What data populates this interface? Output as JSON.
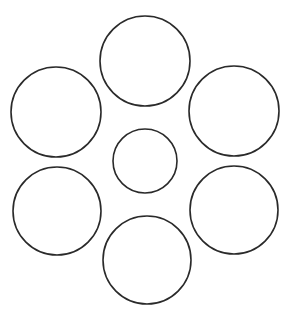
{
  "diagram": {
    "width": 296,
    "height": 324,
    "background": "#ffffff",
    "stroke_color": "#2a2a2a",
    "stroke_width": 1.6,
    "fill": "none",
    "circles": [
      {
        "id": "top",
        "cx": 145,
        "cy": 61,
        "r": 45
      },
      {
        "id": "upper-left",
        "cx": 56,
        "cy": 112,
        "r": 45
      },
      {
        "id": "upper-right",
        "cx": 234,
        "cy": 111,
        "r": 45
      },
      {
        "id": "center",
        "cx": 145,
        "cy": 161,
        "r": 32
      },
      {
        "id": "lower-left",
        "cx": 57,
        "cy": 211,
        "r": 44
      },
      {
        "id": "lower-right",
        "cx": 234,
        "cy": 210,
        "r": 44
      },
      {
        "id": "bottom",
        "cx": 147,
        "cy": 260,
        "r": 44
      }
    ]
  }
}
